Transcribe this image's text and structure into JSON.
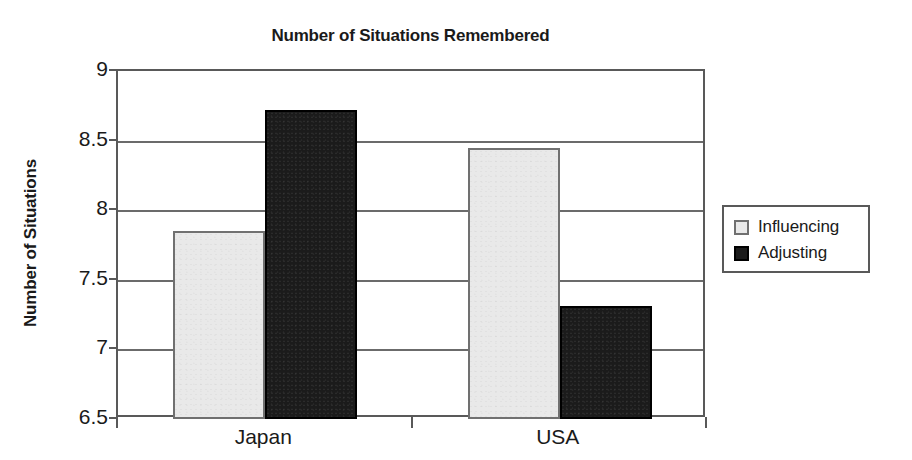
{
  "chart_data": {
    "type": "bar",
    "title": "Number of Situations Remembered",
    "xlabel": "",
    "ylabel": "Number of Situations",
    "categories": [
      "Japan",
      "USA"
    ],
    "series": [
      {
        "name": "Influencing",
        "values": [
          7.85,
          8.45
        ],
        "color": "#e9e9e9"
      },
      {
        "name": "Adjusting",
        "values": [
          8.72,
          7.31
        ],
        "color": "#1b1b1b"
      }
    ],
    "ylim": [
      6.5,
      9.0
    ],
    "ytick_values": [
      9,
      8.5,
      8,
      7.5,
      7,
      6.5
    ],
    "ytick_labels": [
      "9",
      "8.5",
      "8",
      "7.5",
      "7",
      "6.5"
    ],
    "grid": true,
    "legend_position": "right"
  },
  "legend": {
    "items": [
      {
        "label": "Influencing",
        "swatch": "light"
      },
      {
        "label": "Adjusting",
        "swatch": "dark"
      }
    ]
  }
}
